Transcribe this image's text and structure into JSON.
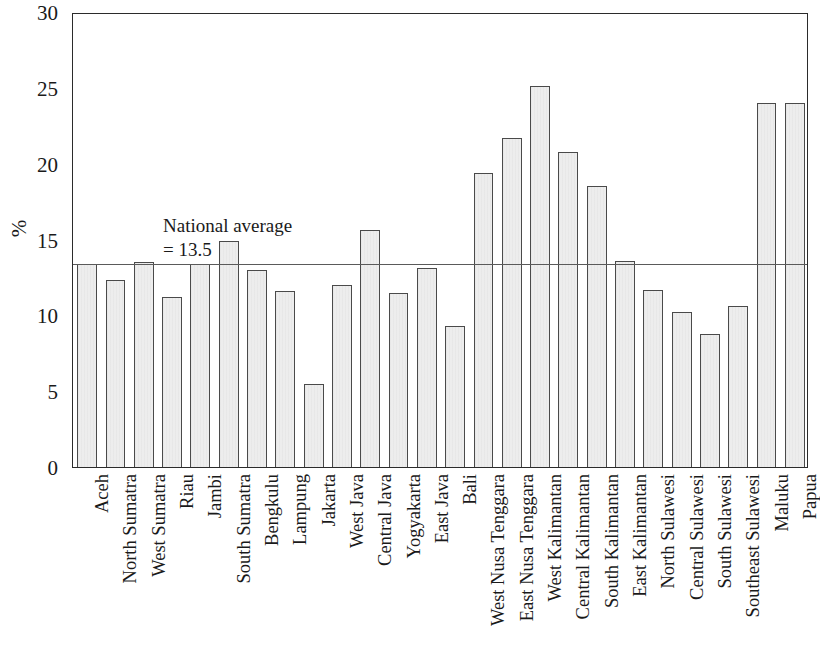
{
  "chart_data": {
    "type": "bar",
    "title": "",
    "xlabel": "",
    "ylabel": "%",
    "ylim": [
      0,
      30
    ],
    "y_ticks": [
      0,
      5,
      10,
      15,
      20,
      25,
      30
    ],
    "grid": false,
    "legend": null,
    "annotations": [
      {
        "name": "national-average",
        "line1": "National average",
        "line2": "= 13.5",
        "value": 13.5,
        "type": "horizontal-reference-line"
      }
    ],
    "categories": [
      "Aceh",
      "North Sumatra",
      "West Sumatra",
      "Riau",
      "Jambi",
      "South Sumatra",
      "Bengkulu",
      "Lampung",
      "Jakarta",
      "West Java",
      "Central Java",
      "Yogyakarta",
      "East Java",
      "Bali",
      "West Nusa Tenggara",
      "East Nusa Tenggara",
      "West Kalimantan",
      "Central Kalimantan",
      "South Kalimantan",
      "East Kalimantan",
      "North Sulawesi",
      "Central Sulawesi",
      "South Sulawesi",
      "Southeast Sulawesi",
      "Maluku",
      "Papua"
    ],
    "values": [
      13.4,
      12.3,
      13.5,
      11.2,
      13.4,
      14.9,
      13.0,
      11.6,
      5.5,
      12.0,
      15.6,
      11.5,
      13.1,
      9.3,
      19.4,
      21.7,
      25.1,
      20.8,
      18.5,
      13.6,
      11.7,
      10.2,
      8.8,
      10.6,
      24.0,
      24.0
    ],
    "colors": {
      "bar_fill": "#ededed",
      "bar_stroke": "#4a4a4a",
      "axis": "#2b2b2b",
      "average_line": "#5a5a5a",
      "text": "#1a1a1a"
    }
  }
}
